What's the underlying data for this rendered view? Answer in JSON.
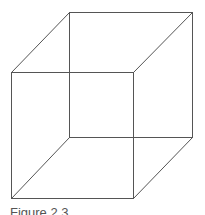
{
  "figure": {
    "caption": "Figure 2.3",
    "stroke_color": "#555555",
    "background": "#ffffff"
  }
}
